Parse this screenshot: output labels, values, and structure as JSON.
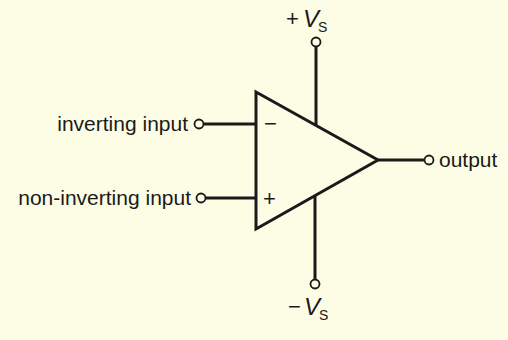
{
  "diagram": {
    "labels": {
      "inverting_input": "inverting input",
      "non_inverting_input": "non-inverting input",
      "output": "output",
      "minus_sign": "−",
      "plus_sign": "+",
      "pos_supply_sign": "+",
      "neg_supply_sign": "−",
      "supply_var": "V",
      "supply_sub": "S"
    },
    "colors": {
      "background": "#fdfde6",
      "stroke": "#1a1a1a"
    }
  }
}
